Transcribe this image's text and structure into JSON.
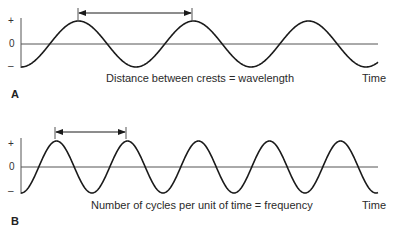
{
  "panels": [
    {
      "id": "A",
      "label": "A",
      "axis_labels": {
        "plus": "+",
        "zero": "0",
        "minus": "–"
      },
      "caption": "Distance between crests = wavelength",
      "x_label": "Time",
      "geometry": {
        "axis_x": 21,
        "baseline_y": 44,
        "amplitude": 23,
        "period": 115,
        "x_start": 21,
        "x_end": 378,
        "arrow_y": 13,
        "arrow_x1": 78,
        "arrow_x2": 192
      }
    },
    {
      "id": "B",
      "label": "B",
      "axis_labels": {
        "plus": "+",
        "zero": "0",
        "minus": "–"
      },
      "caption": "Number of cycles per unit of time = frequency",
      "x_label": "Time",
      "geometry": {
        "axis_x": 21,
        "baseline_y": 167,
        "amplitude": 26,
        "period": 71,
        "x_start": 21,
        "x_end": 378,
        "arrow_y": 132,
        "arrow_x1": 55,
        "arrow_x2": 126
      }
    }
  ],
  "colors": {
    "line": "#1a1a1a",
    "axis": "#555555"
  }
}
